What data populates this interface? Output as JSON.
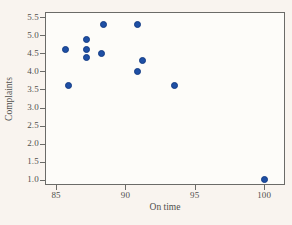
{
  "chart_data": {
    "type": "scatter",
    "title": "",
    "xlabel": "On time",
    "ylabel": "Complaints",
    "xlim": [
      84.2,
      101.5
    ],
    "ylim": [
      0.85,
      5.65
    ],
    "grid": false,
    "legend": null,
    "x_ticks": [
      "85",
      "90",
      "95",
      "100"
    ],
    "x_tick_values": [
      85,
      90,
      95,
      100
    ],
    "y_ticks": [
      "5.5",
      "5.0",
      "4.5",
      "4.0",
      "3.5",
      "3.0",
      "2.5",
      "2.0",
      "1.5",
      "1.0"
    ],
    "y_tick_values": [
      5.5,
      5.0,
      4.5,
      4.0,
      3.5,
      3.0,
      2.5,
      2.0,
      1.5,
      1.0
    ],
    "points": [
      {
        "x": 85.7,
        "y": 4.6
      },
      {
        "x": 85.9,
        "y": 3.6
      },
      {
        "x": 87.2,
        "y": 4.9
      },
      {
        "x": 87.2,
        "y": 4.6
      },
      {
        "x": 87.2,
        "y": 4.4
      },
      {
        "x": 88.4,
        "y": 5.3
      },
      {
        "x": 88.3,
        "y": 4.5
      },
      {
        "x": 90.9,
        "y": 5.3
      },
      {
        "x": 91.2,
        "y": 4.3
      },
      {
        "x": 90.9,
        "y": 4.0
      },
      {
        "x": 93.5,
        "y": 3.6
      },
      {
        "x": 100.0,
        "y": 1.0
      }
    ]
  },
  "colors": {
    "page_bg": "#f9f4ef",
    "plot_bg": "#fdfcf9",
    "axis": "#6b6b68",
    "text": "#50504d",
    "point_fill": "#1e4fa5",
    "point_edge": "#143c85"
  }
}
